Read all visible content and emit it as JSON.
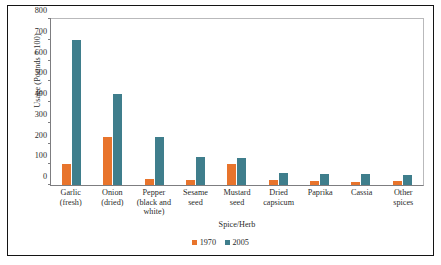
{
  "chart_data": {
    "type": "bar",
    "title": "",
    "xlabel": "Spice/Herb",
    "ylabel": "Usage (Pounds * 100)",
    "ylim": [
      0,
      800
    ],
    "yticks": [
      800,
      700,
      600,
      500,
      400,
      300,
      200,
      100,
      0
    ],
    "grid": false,
    "legend_position": "bottom",
    "categories": [
      "Garlic (fresh)",
      "Onion (dried)",
      "Pepper (black and white)",
      "Sesame seed",
      "Mustard seed",
      "Dried capsicum",
      "Paprika",
      "Cassia",
      "Other spices"
    ],
    "category_lines": [
      [
        "Garlic",
        "(fresh)"
      ],
      [
        "Onion",
        "(dried)"
      ],
      [
        "Pepper",
        "(black and",
        "white)"
      ],
      [
        "Sesame seed"
      ],
      [
        "Mustard",
        "seed"
      ],
      [
        "Dried",
        "capsicum"
      ],
      [
        "Paprika"
      ],
      [
        "Cassia"
      ],
      [
        "Other spices"
      ]
    ],
    "series": [
      {
        "name": "1970",
        "color": "#E8742C",
        "values": [
          100,
          230,
          30,
          25,
          100,
          25,
          20,
          15,
          20
        ]
      },
      {
        "name": "2005",
        "color": "#3F7E8C",
        "values": [
          700,
          440,
          230,
          135,
          130,
          60,
          55,
          55,
          50
        ]
      }
    ]
  }
}
